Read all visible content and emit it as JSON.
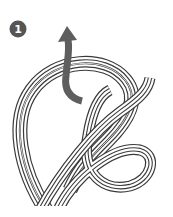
{
  "diagram": {
    "type": "knot-tying-step",
    "step": {
      "number": "1"
    },
    "colors": {
      "background": "#ffffff",
      "rope_outline": "#3a3a3a",
      "rope_fill": "#ffffff",
      "arrow": "#5e5e5e",
      "badge": "#555555"
    },
    "elements": [
      {
        "name": "step-badge",
        "label": "1"
      },
      {
        "name": "direction-arrow",
        "direction": "up"
      },
      {
        "name": "rope",
        "description": "multi-strand rope forming a figure-eight loop"
      }
    ]
  }
}
